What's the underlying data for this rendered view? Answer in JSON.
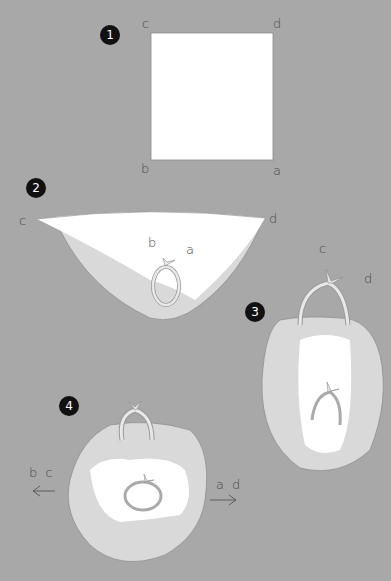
{
  "colors": {
    "background": "#a8a8a8",
    "fabric": "#d9d9d9",
    "fabric_inner": "#ffffff",
    "outline": "#8a8a8a",
    "step_badge": "#111111"
  },
  "steps": [
    {
      "number": "1",
      "labels": {
        "top_left": "c",
        "top_right": "d",
        "bottom_left": "b",
        "bottom_right": "a"
      }
    },
    {
      "number": "2",
      "labels": {
        "left": "c",
        "right": "d",
        "knot_left": "b",
        "knot_right": "a"
      }
    },
    {
      "number": "3",
      "labels": {
        "top": "c",
        "right": "d"
      }
    },
    {
      "number": "4",
      "labels": {
        "left": "b c",
        "right": "a d"
      },
      "arrows": {
        "left": "←",
        "right": "→"
      }
    }
  ]
}
